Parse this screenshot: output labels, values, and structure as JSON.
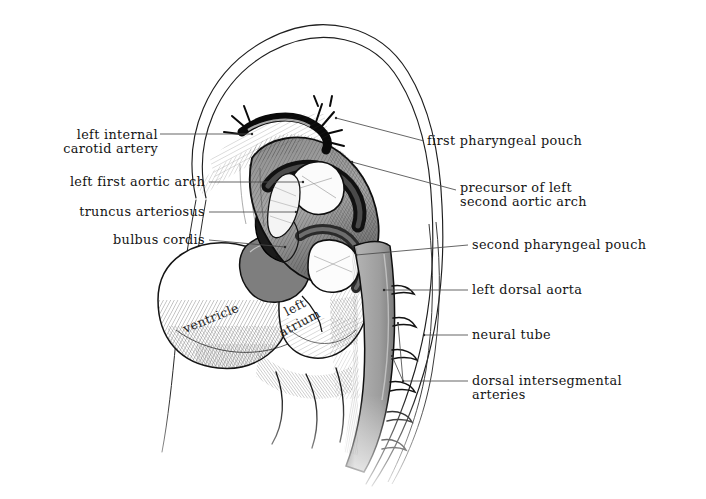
{
  "figure": {
    "background_color": "#ffffff",
    "ink_color": "#141414",
    "vessel_fill_color": "#a6a6a6",
    "leader_color": "#5a5a5a"
  },
  "labels_left": [
    {
      "name": "left-internal-carotid-artery",
      "line1": "left internal",
      "line2": "carotid artery",
      "text_right_x": 158,
      "line1_y": 139,
      "line2_y": 154,
      "leader": {
        "x1": 160,
        "y1": 134,
        "x2": 252,
        "y2": 134
      }
    },
    {
      "name": "left-first-aortic-arch",
      "line1": "left first aortic arch",
      "line2": "",
      "text_right_x": 205,
      "line1_y": 186,
      "line2_y": 0,
      "leader": {
        "x1": 209,
        "y1": 182,
        "x2": 303,
        "y2": 182
      }
    },
    {
      "name": "truncus-arteriosus",
      "line1": "truncus arteriosus",
      "line2": "",
      "text_right_x": 205,
      "line1_y": 216,
      "line2_y": 0,
      "leader": {
        "x1": 209,
        "y1": 212,
        "x2": 296,
        "y2": 212
      }
    },
    {
      "name": "bulbus-cordis",
      "line1": "bulbus cordis",
      "line2": "",
      "text_right_x": 205,
      "line1_y": 244,
      "line2_y": 0,
      "leader": {
        "x1": 209,
        "y1": 240,
        "x2": 285,
        "y2": 247
      }
    }
  ],
  "labels_right": [
    {
      "name": "first-pharyngeal-pouch",
      "line1": "first pharyngeal pouch",
      "line2": "",
      "text_left_x": 427,
      "line1_y": 145,
      "line2_y": 0,
      "leader": {
        "x1": 424,
        "y1": 141,
        "x2": 336,
        "y2": 118
      }
    },
    {
      "name": "precursor-of-left-second-aortic-arch",
      "line1": "precursor of left",
      "line2": "second aortic arch",
      "text_left_x": 460,
      "line1_y": 192,
      "line2_y": 207,
      "leader": {
        "x1": 456,
        "y1": 190,
        "x2": 352,
        "y2": 162
      }
    },
    {
      "name": "second-pharyngeal-pouch",
      "line1": "second pharyngeal pouch",
      "line2": "",
      "text_left_x": 472,
      "line1_y": 249,
      "line2_y": 0,
      "leader": {
        "x1": 468,
        "y1": 245,
        "x2": 356,
        "y2": 255
      }
    },
    {
      "name": "left-dorsal-aorta",
      "line1": "left dorsal aorta",
      "line2": "",
      "text_left_x": 472,
      "line1_y": 294,
      "line2_y": 0,
      "leader": {
        "x1": 468,
        "y1": 290,
        "x2": 384,
        "y2": 290
      }
    },
    {
      "name": "neural-tube",
      "line1": "neural tube",
      "line2": "",
      "text_left_x": 472,
      "line1_y": 339,
      "line2_y": 0,
      "leader": {
        "x1": 468,
        "y1": 335,
        "x2": 424,
        "y2": 335
      }
    },
    {
      "name": "dorsal-intersegmental-arteries",
      "line1": "dorsal intersegmental",
      "line2": "arteries",
      "text_left_x": 472,
      "line1_y": 385,
      "line2_y": 400,
      "leader": {
        "x1": 468,
        "y1": 381,
        "x2": 403,
        "y2": 381
      }
    }
  ],
  "labels_infigure": [
    {
      "name": "ventricle",
      "text": "ventricle",
      "x": 186,
      "y": 322,
      "rotate": -22
    },
    {
      "name": "left-atrium-line1",
      "text": "left",
      "x": 288,
      "y": 305,
      "rotate": -28
    },
    {
      "name": "left-atrium-line2",
      "text": "atrium",
      "x": 283,
      "y": 326,
      "rotate": -28
    }
  ],
  "anatomy_parts": [
    "head-fold-outline",
    "body-wall-outline",
    "heart-ventricle",
    "heart-left-atrium",
    "truncus-arteriosus",
    "bulbus-cordis",
    "first-aortic-arch",
    "second-aortic-arch-precursor",
    "first-pharyngeal-pouch",
    "second-pharyngeal-pouch",
    "left-dorsal-aorta",
    "neural-tube",
    "dorsal-intersegmental-arteries",
    "internal-carotid-artery"
  ]
}
